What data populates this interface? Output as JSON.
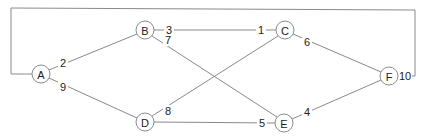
{
  "diagram": {
    "type": "weighted-graph",
    "nodes": [
      {
        "id": "A",
        "label": "A",
        "x": 41,
        "y": 74
      },
      {
        "id": "B",
        "label": "B",
        "x": 145,
        "y": 30
      },
      {
        "id": "C",
        "label": "C",
        "x": 285,
        "y": 30
      },
      {
        "id": "D",
        "label": "D",
        "x": 145,
        "y": 122
      },
      {
        "id": "E",
        "label": "E",
        "x": 284,
        "y": 123
      },
      {
        "id": "F",
        "label": "F",
        "x": 389,
        "y": 76
      }
    ],
    "edges": [
      {
        "from": "A",
        "to": "B",
        "weight": "2",
        "label_x": 63,
        "label_y": 63
      },
      {
        "from": "A",
        "to": "D",
        "weight": "9",
        "label_x": 63,
        "label_y": 87
      },
      {
        "from": "B",
        "to": "C",
        "weight_near_B": "3",
        "weight_near_C": "1",
        "weight": "3 / 1",
        "label_x": 169,
        "label_y": 30,
        "label2_x": 261,
        "label2_y": 30
      },
      {
        "from": "B",
        "to": "E",
        "weight": "7",
        "label_x": 168,
        "label_y": 40
      },
      {
        "from": "C",
        "to": "F",
        "weight": "6",
        "label_x": 307,
        "label_y": 42
      },
      {
        "from": "D",
        "to": "C",
        "weight": "8",
        "label_x": 168,
        "label_y": 111
      },
      {
        "from": "D",
        "to": "E",
        "weight": "5",
        "label_x": 262,
        "label_y": 123
      },
      {
        "from": "E",
        "to": "F",
        "weight": "4",
        "label_x": 307,
        "label_y": 112
      },
      {
        "from": "F",
        "to": "A",
        "weight": "10",
        "routing": "outer-loop-top",
        "label_x": 404,
        "label_y": 76
      }
    ],
    "colors": {
      "edge": "#8a8a8a",
      "node_stroke": "#8a8a8a",
      "node_fill": "#ffffff",
      "text": "#222222",
      "background": "#ffffff"
    }
  },
  "labels": {
    "node_A": "A",
    "node_B": "B",
    "node_C": "C",
    "node_D": "D",
    "node_E": "E",
    "node_F": "F",
    "w_AB": "2",
    "w_AD": "9",
    "w_BC_b": "3",
    "w_BC_c": "1",
    "w_BE": "7",
    "w_CF": "6",
    "w_DC": "8",
    "w_DE": "5",
    "w_EF": "4",
    "w_FA": "10"
  }
}
